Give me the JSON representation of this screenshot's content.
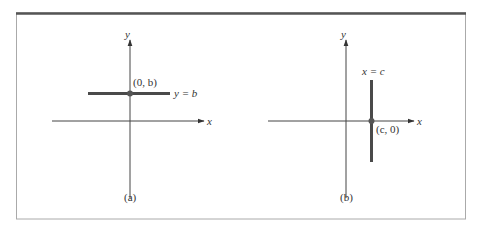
{
  "figure": {
    "panels": [
      {
        "id": "a",
        "caption": "(a)",
        "x_axis_label": "x",
        "y_axis_label": "y",
        "line_label": "y = b",
        "point_label": "(0, b)"
      },
      {
        "id": "b",
        "caption": "(b)",
        "x_axis_label": "x",
        "y_axis_label": "y",
        "line_label": "x = c",
        "point_label": "(c, 0)"
      }
    ],
    "colors": {
      "frame_top": "#555555",
      "frame_border": "#aaaaaa",
      "axis": "#444444",
      "line": "#4a4a4a",
      "point": "#555555"
    }
  }
}
